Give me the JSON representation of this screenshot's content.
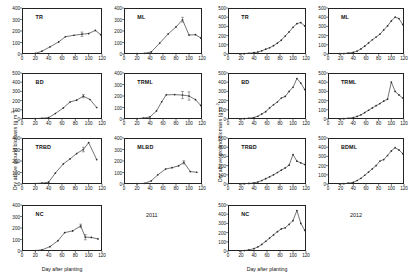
{
  "figure": {
    "y_axis_title_main": "Dry above ground biomass (g m",
    "y_axis_title_exp": "-2",
    "y_axis_title_tail": ")",
    "x_axis_title": "Day after planting"
  },
  "columns": [
    {
      "id": "col-2011",
      "year_label": "2011"
    },
    {
      "id": "col-2012",
      "year_label": "2012"
    }
  ],
  "chart_data": [
    {
      "type": "line",
      "panel": "TR",
      "year": "2011",
      "title": "TR",
      "xlabel": "Day after planting",
      "ylabel": "Dry above ground biomass (g m-2)",
      "xlim": [
        0,
        120
      ],
      "ylim": [
        0,
        400
      ],
      "yticks": [
        0,
        100,
        200,
        300,
        400
      ],
      "xticks": [
        0,
        20,
        40,
        60,
        80,
        100,
        120
      ],
      "grid": false,
      "x": [
        20,
        30,
        42,
        55,
        65,
        78,
        90,
        100,
        110,
        118
      ],
      "y": [
        5,
        25,
        62,
        105,
        150,
        163,
        172,
        178,
        205,
        168
      ],
      "errors": [
        0,
        0,
        0,
        0,
        0,
        0,
        38,
        0,
        0,
        0
      ]
    },
    {
      "type": "line",
      "panel": "ML",
      "year": "2011",
      "title": "ML",
      "xlabel": "Day after planting",
      "ylabel": "Dry above ground biomass (g m-2)",
      "xlim": [
        0,
        120
      ],
      "ylim": [
        0,
        400
      ],
      "yticks": [
        0,
        100,
        200,
        300,
        400
      ],
      "xticks": [
        0,
        20,
        40,
        60,
        80,
        100,
        120
      ],
      "grid": false,
      "x": [
        20,
        32,
        42,
        55,
        68,
        80,
        90,
        100,
        110,
        118
      ],
      "y": [
        3,
        6,
        18,
        95,
        175,
        235,
        298,
        165,
        168,
        140
      ],
      "errors": [
        0,
        0,
        0,
        0,
        0,
        0,
        42,
        0,
        0,
        0
      ]
    },
    {
      "type": "line",
      "panel": "BD",
      "year": "2011",
      "title": "BD",
      "xlabel": "Day after planting",
      "ylabel": "Dry above ground biomass (g m-2)",
      "xlim": [
        0,
        120
      ],
      "ylim": [
        0,
        500
      ],
      "yticks": [
        0,
        100,
        200,
        300,
        400,
        500
      ],
      "xticks": [
        0,
        20,
        40,
        60,
        80,
        100,
        120
      ],
      "grid": false,
      "x": [
        20,
        30,
        40,
        50,
        62,
        72,
        82,
        92,
        102,
        112
      ],
      "y": [
        4,
        8,
        15,
        60,
        120,
        185,
        205,
        248,
        212,
        125
      ],
      "errors": [
        0,
        0,
        0,
        0,
        0,
        0,
        0,
        35,
        0,
        0
      ]
    },
    {
      "type": "line",
      "panel": "TRML",
      "year": "2011",
      "title": "TRML",
      "xlabel": "Day after planting",
      "ylabel": "Dry above ground biomass (g m-2)",
      "xlim": [
        0,
        120
      ],
      "ylim": [
        0,
        400
      ],
      "yticks": [
        0,
        100,
        200,
        300,
        400
      ],
      "xticks": [
        0,
        20,
        40,
        60,
        80,
        100,
        120
      ],
      "grid": false,
      "x": [
        20,
        30,
        40,
        50,
        58,
        65,
        78,
        90,
        100,
        110,
        118
      ],
      "y": [
        3,
        8,
        18,
        70,
        150,
        210,
        212,
        208,
        200,
        168,
        118
      ],
      "errors": [
        0,
        0,
        0,
        0,
        0,
        0,
        0,
        62,
        72,
        0,
        0
      ]
    },
    {
      "type": "line",
      "panel": "TRBD",
      "year": "2011",
      "title": "TRBD",
      "xlabel": "Day after planting",
      "ylabel": "Dry above ground biomass (g m-2)",
      "xlim": [
        0,
        120
      ],
      "ylim": [
        0,
        400
      ],
      "yticks": [
        0,
        100,
        200,
        300,
        400
      ],
      "xticks": [
        0,
        20,
        40,
        60,
        80,
        100,
        120
      ],
      "grid": false,
      "x": [
        20,
        30,
        40,
        50,
        62,
        72,
        82,
        92,
        100,
        112
      ],
      "y": [
        4,
        8,
        16,
        95,
        175,
        218,
        265,
        300,
        360,
        212
      ],
      "errors": [
        0,
        0,
        0,
        0,
        0,
        0,
        0,
        40,
        0,
        0
      ]
    },
    {
      "type": "line",
      "panel": "MLBD",
      "year": "2011",
      "title": "MLBD",
      "xlabel": "Day after planting",
      "ylabel": "Dry above ground biomass (g m-2)",
      "xlim": [
        0,
        120
      ],
      "ylim": [
        0,
        400
      ],
      "yticks": [
        0,
        100,
        200,
        300,
        400
      ],
      "xticks": [
        0,
        20,
        40,
        60,
        80,
        100,
        120
      ],
      "grid": false,
      "x": [
        20,
        32,
        42,
        52,
        64,
        74,
        84,
        92,
        102,
        112
      ],
      "y": [
        3,
        6,
        28,
        80,
        130,
        142,
        158,
        188,
        108,
        102
      ],
      "errors": [
        0,
        0,
        0,
        0,
        0,
        0,
        0,
        28,
        0,
        0
      ]
    },
    {
      "type": "line",
      "panel": "NC",
      "year": "2011",
      "title": "NC",
      "xlabel": "Day after planting",
      "ylabel": "Dry above ground biomass (g m-2)",
      "xlim": [
        0,
        120
      ],
      "ylim": [
        0,
        400
      ],
      "yticks": [
        0,
        100,
        200,
        300,
        400
      ],
      "xticks": [
        0,
        20,
        40,
        60,
        80,
        100,
        120
      ],
      "grid": false,
      "x": [
        20,
        30,
        42,
        54,
        64,
        76,
        88,
        95,
        104,
        114
      ],
      "y": [
        4,
        10,
        38,
        90,
        160,
        175,
        218,
        120,
        118,
        105
      ],
      "errors": [
        0,
        0,
        0,
        0,
        0,
        0,
        30,
        45,
        0,
        0
      ]
    },
    {
      "type": "line",
      "panel": "TR",
      "year": "2012",
      "title": "TR",
      "xlabel": "Day after planting",
      "ylabel": "Dry above ground biomass (g m-2)",
      "xlim": [
        0,
        120
      ],
      "ylim": [
        0,
        500
      ],
      "yticks": [
        0,
        100,
        200,
        300,
        400,
        500
      ],
      "xticks": [
        0,
        20,
        40,
        60,
        80,
        100,
        120
      ],
      "grid": false,
      "x": [
        18,
        25,
        32,
        40,
        46,
        52,
        58,
        64,
        70,
        76,
        82,
        88,
        94,
        100,
        106,
        112,
        118
      ],
      "y": [
        2,
        4,
        8,
        14,
        22,
        35,
        52,
        68,
        90,
        118,
        150,
        195,
        240,
        290,
        330,
        342,
        305
      ],
      "errors": [
        0,
        0,
        0,
        0,
        0,
        0,
        0,
        0,
        0,
        0,
        0,
        0,
        0,
        0,
        0,
        0,
        0
      ]
    },
    {
      "type": "line",
      "panel": "ML",
      "year": "2012",
      "title": "ML",
      "xlabel": "Day after planting",
      "ylabel": "Dry above ground biomass (g m-2)",
      "xlim": [
        0,
        120
      ],
      "ylim": [
        0,
        500
      ],
      "yticks": [
        0,
        100,
        200,
        300,
        400,
        500
      ],
      "xticks": [
        0,
        20,
        40,
        60,
        80,
        100,
        120
      ],
      "grid": false,
      "x": [
        18,
        25,
        32,
        40,
        46,
        52,
        58,
        64,
        70,
        76,
        82,
        88,
        94,
        100,
        106,
        112,
        118
      ],
      "y": [
        3,
        5,
        10,
        18,
        32,
        55,
        85,
        120,
        155,
        185,
        215,
        262,
        305,
        360,
        400,
        385,
        320
      ],
      "errors": [
        0,
        0,
        0,
        0,
        0,
        0,
        0,
        0,
        0,
        0,
        0,
        0,
        0,
        0,
        0,
        0,
        0
      ]
    },
    {
      "type": "line",
      "panel": "BD",
      "year": "2012",
      "title": "BD",
      "xlabel": "Day after planting",
      "ylabel": "Dry above ground biomass (g m-2)",
      "xlim": [
        0,
        120
      ],
      "ylim": [
        0,
        500
      ],
      "yticks": [
        0,
        100,
        200,
        300,
        400,
        500
      ],
      "xticks": [
        0,
        20,
        40,
        60,
        80,
        100,
        120
      ],
      "grid": false,
      "x": [
        18,
        25,
        32,
        40,
        46,
        52,
        58,
        64,
        70,
        76,
        82,
        88,
        94,
        100,
        106,
        112,
        118
      ],
      "y": [
        2,
        4,
        8,
        16,
        30,
        55,
        80,
        120,
        155,
        185,
        228,
        245,
        300,
        345,
        440,
        390,
        320
      ],
      "errors": [
        0,
        0,
        0,
        0,
        0,
        0,
        0,
        0,
        0,
        0,
        0,
        0,
        0,
        0,
        0,
        0,
        0
      ]
    },
    {
      "type": "line",
      "panel": "TRML",
      "year": "2012",
      "title": "TRML",
      "xlabel": "Day after planting",
      "ylabel": "Dry above ground biomass (g m-2)",
      "xlim": [
        0,
        120
      ],
      "ylim": [
        0,
        500
      ],
      "yticks": [
        0,
        100,
        200,
        300,
        400,
        500
      ],
      "xticks": [
        0,
        20,
        40,
        60,
        80,
        100,
        120
      ],
      "grid": false,
      "x": [
        18,
        25,
        32,
        40,
        46,
        52,
        58,
        64,
        70,
        76,
        82,
        88,
        94,
        100,
        106,
        112,
        118
      ],
      "y": [
        2,
        4,
        8,
        15,
        28,
        45,
        70,
        95,
        120,
        145,
        168,
        195,
        215,
        400,
        300,
        262,
        228
      ],
      "errors": [
        0,
        0,
        0,
        0,
        0,
        0,
        0,
        0,
        0,
        0,
        0,
        0,
        0,
        0,
        0,
        0,
        0
      ]
    },
    {
      "type": "line",
      "panel": "TRBD",
      "year": "2012",
      "title": "TRBD",
      "xlabel": "Day after planting",
      "ylabel": "Dry above ground biomass (g m-2)",
      "xlim": [
        0,
        120
      ],
      "ylim": [
        0,
        500
      ],
      "yticks": [
        0,
        100,
        200,
        300,
        400,
        500
      ],
      "xticks": [
        0,
        20,
        40,
        60,
        80,
        100,
        120
      ],
      "grid": false,
      "x": [
        18,
        25,
        32,
        40,
        46,
        52,
        58,
        64,
        70,
        76,
        82,
        88,
        94,
        100,
        106,
        112,
        118
      ],
      "y": [
        2,
        3,
        6,
        12,
        22,
        38,
        58,
        78,
        100,
        125,
        150,
        175,
        205,
        320,
        248,
        230,
        212
      ],
      "errors": [
        0,
        0,
        0,
        0,
        0,
        0,
        0,
        0,
        0,
        0,
        0,
        0,
        0,
        0,
        0,
        0,
        0
      ]
    },
    {
      "type": "line",
      "panel": "BDML",
      "year": "2012",
      "title": "BDML",
      "xlabel": "Day after planting",
      "ylabel": "Dry above ground biomass (g m-2)",
      "xlim": [
        0,
        120
      ],
      "ylim": [
        0,
        500
      ],
      "yticks": [
        0,
        100,
        200,
        300,
        400,
        500
      ],
      "xticks": [
        0,
        20,
        40,
        60,
        80,
        100,
        120
      ],
      "grid": false,
      "x": [
        18,
        25,
        32,
        40,
        46,
        52,
        58,
        64,
        70,
        76,
        82,
        88,
        94,
        100,
        106,
        112,
        118
      ],
      "y": [
        2,
        4,
        9,
        18,
        38,
        62,
        95,
        130,
        165,
        200,
        250,
        265,
        310,
        360,
        395,
        370,
        330
      ],
      "errors": [
        0,
        0,
        0,
        0,
        0,
        0,
        0,
        0,
        0,
        0,
        0,
        0,
        0,
        0,
        0,
        0,
        0
      ]
    },
    {
      "type": "line",
      "panel": "NC",
      "year": "2012",
      "title": "NC",
      "xlabel": "Day after planting",
      "ylabel": "Dry above ground biomass (g m-2)",
      "xlim": [
        0,
        120
      ],
      "ylim": [
        0,
        500
      ],
      "yticks": [
        0,
        100,
        200,
        300,
        400,
        500
      ],
      "xticks": [
        0,
        20,
        40,
        60,
        80,
        100,
        120
      ],
      "grid": false,
      "x": [
        18,
        25,
        32,
        40,
        46,
        52,
        58,
        64,
        70,
        76,
        82,
        88,
        94,
        100,
        106,
        112,
        118
      ],
      "y": [
        2,
        5,
        12,
        25,
        45,
        72,
        105,
        140,
        175,
        210,
        240,
        252,
        290,
        330,
        440,
        300,
        225
      ],
      "errors": [
        0,
        0,
        0,
        0,
        0,
        0,
        0,
        0,
        0,
        0,
        0,
        0,
        0,
        0,
        0,
        0,
        0
      ]
    }
  ]
}
